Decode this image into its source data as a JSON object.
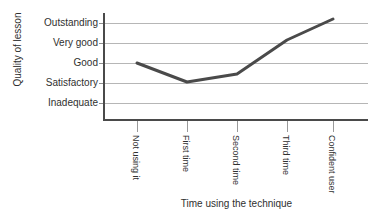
{
  "figure": {
    "background_color": "#ffffff",
    "axis_color": "#4a4a4a",
    "grid_color": "#b6b6b6",
    "series_color": "#4a4a4a"
  },
  "axes": {
    "y_title": "Quality of lesson",
    "x_title": "Time using the technique"
  },
  "chart_data": {
    "type": "line",
    "title": "",
    "subtitle": "",
    "xlabel": "Time using the technique",
    "ylabel": "Quality of lesson",
    "categories": [
      "Not using it",
      "First time",
      "Second time",
      "Third time",
      "Confident user"
    ],
    "y_tick_labels": [
      "Inadequate",
      "Satisfactory",
      "Good",
      "Very good",
      "Outstanding"
    ],
    "y_tick_values": [
      1,
      2,
      3,
      4,
      5
    ],
    "ylim": [
      0.55,
      5.35
    ],
    "grid": true,
    "grid_axis": "y",
    "legend": false,
    "legend_position": "none",
    "series": [
      {
        "name": "Quality of lesson",
        "values": [
          3.0,
          2.05,
          2.45,
          4.15,
          5.2
        ],
        "value_labels": [
          "Good",
          "Just above Satisfactory",
          "Between Satisfactory and Good",
          "Just above Very good",
          "Above Outstanding"
        ],
        "color": "#4a4a4a",
        "line_width": 3,
        "markers": false
      }
    ],
    "annotations": []
  }
}
